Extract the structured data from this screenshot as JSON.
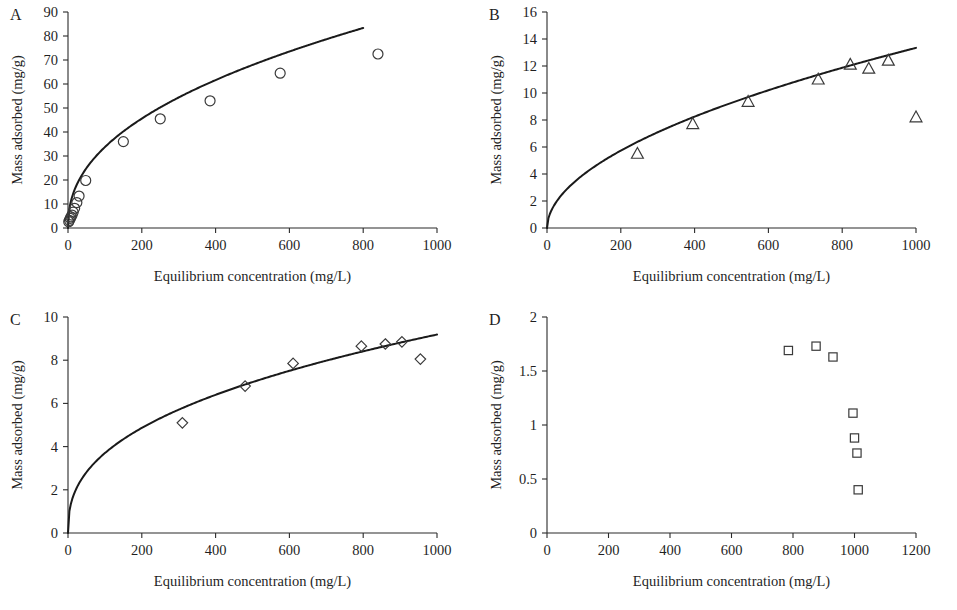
{
  "figure": {
    "axis_titles": {
      "x": "Equilibrium concentration (mg/L)",
      "y": "Mass adsorbed (mg/g)"
    }
  },
  "chart_data": [
    {
      "type": "scatter",
      "panel": "A",
      "title": "",
      "xlabel": "Equilibrium concentration (mg/L)",
      "ylabel": "Mass adsorbed (mg/g)",
      "xlim": [
        0,
        1000
      ],
      "ylim": [
        0,
        90
      ],
      "xticks": [
        0,
        200,
        400,
        600,
        800,
        1000
      ],
      "yticks": [
        0,
        10,
        20,
        30,
        40,
        50,
        60,
        70,
        80,
        90
      ],
      "grid": false,
      "legend": "none",
      "marker": "circle",
      "x": [
        2,
        4,
        6,
        8,
        11,
        14,
        18,
        24,
        30,
        48,
        150,
        250,
        385,
        575,
        840
      ],
      "y": [
        2.6,
        3.2,
        4.0,
        4.6,
        5.4,
        6.6,
        8.2,
        10.6,
        13.3,
        19.8,
        36.0,
        45.5,
        53.0,
        64.5,
        72.5
      ],
      "fit": {
        "model": "freundlich",
        "coefficient": 4.55,
        "exponent": 0.435,
        "x_start": 0,
        "x_end": 800
      }
    },
    {
      "type": "scatter",
      "panel": "B",
      "title": "",
      "xlabel": "Equilibrium concentration (mg/L)",
      "ylabel": "Mass adsorbed (mg/g)",
      "xlim": [
        0,
        1000
      ],
      "ylim": [
        0,
        16
      ],
      "xticks": [
        0,
        200,
        400,
        600,
        800,
        1000
      ],
      "yticks": [
        0,
        2,
        4,
        6,
        8,
        10,
        12,
        14,
        16
      ],
      "grid": false,
      "legend": "none",
      "marker": "triangle",
      "x": [
        245,
        395,
        545,
        735,
        822,
        872,
        925,
        1000
      ],
      "y": [
        5.5,
        7.7,
        9.35,
        11.0,
        12.1,
        11.8,
        12.4,
        8.2
      ],
      "fit": {
        "model": "freundlich",
        "coefficient": 0.355,
        "exponent": 0.525,
        "x_start": 0,
        "x_end": 1000
      }
    },
    {
      "type": "scatter",
      "panel": "C",
      "title": "",
      "xlabel": "Equilibrium concentration (mg/L)",
      "ylabel": "Mass adsorbed (mg/g)",
      "xlim": [
        0,
        1000
      ],
      "ylim": [
        0,
        10
      ],
      "xticks": [
        0,
        200,
        400,
        600,
        800,
        1000
      ],
      "yticks": [
        0,
        2,
        4,
        6,
        8,
        10
      ],
      "grid": false,
      "legend": "none",
      "marker": "diamond",
      "x": [
        310,
        480,
        610,
        795,
        860,
        905,
        955
      ],
      "y": [
        5.1,
        6.8,
        7.85,
        8.65,
        8.75,
        8.85,
        8.05
      ],
      "fit": {
        "model": "freundlich",
        "coefficient": 0.6,
        "exponent": 0.395,
        "x_start": 0,
        "x_end": 1000
      }
    },
    {
      "type": "scatter",
      "panel": "D",
      "title": "",
      "xlabel": "Equilibrium concentration (mg/L)",
      "ylabel": "Mass adsorbed (mg/g)",
      "xlim": [
        0,
        1200
      ],
      "ylim": [
        0,
        2
      ],
      "xticks": [
        0,
        200,
        400,
        600,
        800,
        1000,
        1200
      ],
      "yticks": [
        0,
        0.5,
        1,
        1.5,
        2
      ],
      "ytick_labels": [
        "0",
        "0.5",
        "1",
        "1.5",
        "2"
      ],
      "grid": false,
      "legend": "none",
      "marker": "square",
      "x": [
        785,
        875,
        930,
        995,
        1000,
        1008,
        1012
      ],
      "y": [
        1.69,
        1.73,
        1.63,
        1.11,
        0.88,
        0.74,
        0.4
      ],
      "fit": null
    }
  ],
  "panels": {
    "A": {
      "letter": "A"
    },
    "B": {
      "letter": "B"
    },
    "C": {
      "letter": "C"
    },
    "D": {
      "letter": "D"
    }
  }
}
